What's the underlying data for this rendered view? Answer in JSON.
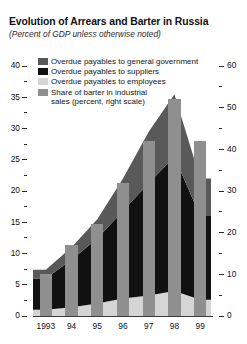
{
  "figure": {
    "title": "Evolution of Arrears and Barter in Russia",
    "subtitle": "(Percent of GDP unless otherwise noted)"
  },
  "legend": {
    "items": [
      {
        "label": "Overdue payables to general government",
        "color": "#595959",
        "name": "legend-general-government"
      },
      {
        "label": "Overdue payables to suppliers",
        "color": "#111111",
        "name": "legend-suppliers"
      },
      {
        "label": "Overdue payables to employees",
        "color": "#d5d5d5",
        "name": "legend-employees"
      },
      {
        "label": "Share of barter in industrial",
        "label2": "sales (percent, right scale)",
        "color": "#8f8f8f",
        "name": "legend-barter"
      }
    ]
  },
  "axes": {
    "left": {
      "ticks": [
        "0",
        "5",
        "10",
        "15",
        "20",
        "25",
        "30",
        "35",
        "40"
      ],
      "min": 0,
      "max": 40,
      "step": 5,
      "minor_step": 2.5
    },
    "right": {
      "ticks": [
        "0",
        "10",
        "20",
        "30",
        "40",
        "50",
        "60"
      ],
      "min": 0,
      "max": 60,
      "step": 10,
      "minor_step": 5
    },
    "x": {
      "ticks": [
        "1993",
        "94",
        "95",
        "96",
        "97",
        "98",
        "99"
      ]
    }
  },
  "chart_data": {
    "type": "bar",
    "title": "Evolution of Arrears and Barter in Russia",
    "subtitle": "(Percent of GDP unless otherwise noted)",
    "xlabel": "",
    "ylabel": "Percent of GDP",
    "ylabel_right": "Percent of industrial sales",
    "categories": [
      "1993",
      "94",
      "95",
      "96",
      "97",
      "98",
      "99"
    ],
    "ylim": [
      0,
      40
    ],
    "ylim_right": [
      0,
      60
    ],
    "grid": false,
    "legend_position": "top-left",
    "series": [
      {
        "name": "Overdue payables to employees",
        "type": "area",
        "stack": "arrears",
        "axis": "left",
        "color": "#d5d5d5",
        "values": [
          1.0,
          1.4,
          2.0,
          2.8,
          3.3,
          4.0,
          2.6
        ]
      },
      {
        "name": "Overdue payables to suppliers",
        "type": "area",
        "stack": "arrears",
        "axis": "left",
        "color": "#111111",
        "values": [
          5.0,
          7.6,
          10.4,
          14.0,
          18.0,
          21.5,
          13.4
        ]
      },
      {
        "name": "Overdue payables to general government",
        "type": "area",
        "stack": "arrears",
        "axis": "left",
        "color": "#595959",
        "values": [
          1.4,
          2.0,
          3.1,
          5.2,
          8.2,
          10.0,
          6.0
        ]
      },
      {
        "name": "Share of barter in industrial sales (percent, right scale)",
        "type": "bar",
        "axis": "right",
        "color": "#8f8f8f",
        "values": [
          10,
          17,
          22,
          32,
          42,
          52,
          42
        ]
      }
    ],
    "stack_totals": [
      7.4,
      11.0,
      15.5,
      22.0,
      29.5,
      35.5,
      22.0
    ]
  }
}
